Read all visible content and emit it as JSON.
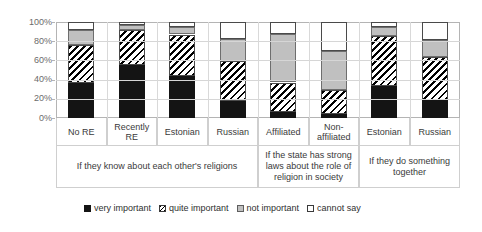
{
  "chart_data": {
    "type": "bar",
    "subtype": "stacked-bar-100-percent",
    "title": "",
    "xlabel": "",
    "ylabel": "",
    "ylim": [
      0,
      100
    ],
    "ytick_labels": [
      "100%",
      "80%",
      "60%",
      "40%",
      "20%",
      "0%"
    ],
    "ytick_values": [
      100,
      80,
      60,
      40,
      20,
      0
    ],
    "grid": true,
    "legend_position": "bottom",
    "categories": [
      "No RE",
      "Recently RE",
      "Estonian",
      "Russian",
      "Affiliated",
      "Non-affiliated",
      "Estonian",
      "Russian"
    ],
    "groups": [
      {
        "label": "If they know about each other's religions",
        "categories": [
          "No RE",
          "Recently RE",
          "Estonian",
          "Russian"
        ]
      },
      {
        "label": "If the state has strong laws about the role of religion in society",
        "categories": [
          "Affiliated",
          "Non-affiliated"
        ]
      },
      {
        "label": "If they do something together",
        "categories": [
          "Estonian",
          "Russian"
        ]
      }
    ],
    "series": [
      {
        "name": "very important",
        "values": [
          36,
          55,
          44,
          18,
          6,
          4,
          33,
          19
        ]
      },
      {
        "name": "quite important",
        "values": [
          40,
          37,
          43,
          41,
          31,
          25,
          52,
          45
        ]
      },
      {
        "name": "not important",
        "values": [
          16,
          5,
          8,
          23,
          51,
          41,
          10,
          17
        ]
      },
      {
        "name": "cannot say",
        "values": [
          8,
          3,
          5,
          18,
          12,
          30,
          5,
          19
        ]
      }
    ],
    "colors": {
      "very important": "#141414",
      "quite important": "#ffffff",
      "not important": "#c0c0c0",
      "cannot say": "#ffffff"
    },
    "patterns": {
      "very important": "solid-black",
      "quite important": "diagonal-hatch",
      "not important": "solid-gray",
      "cannot say": "solid-white"
    }
  },
  "legend": {
    "items": [
      {
        "label": "very important",
        "swatch": "s-very"
      },
      {
        "label": "quite important",
        "swatch": "s-quite"
      },
      {
        "label": "not important",
        "swatch": "s-not"
      },
      {
        "label": "cannot say",
        "swatch": "s-cannot"
      }
    ]
  }
}
